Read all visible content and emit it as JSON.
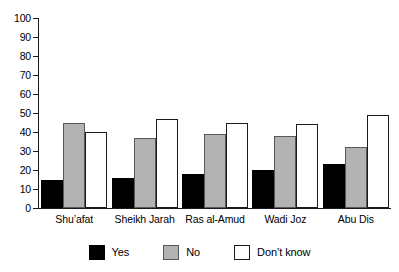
{
  "chart_data": {
    "type": "bar",
    "title": "",
    "xlabel": "",
    "ylabel": "",
    "ylim": [
      0,
      100
    ],
    "yticks": [
      0,
      10,
      20,
      30,
      40,
      50,
      60,
      70,
      80,
      90,
      100
    ],
    "grid": false,
    "legend_position": "bottom",
    "categories": [
      "Shu’afat",
      "Sheikh Jarah",
      "Ras al-Amud",
      "Wadi Joz",
      "Abu Dis"
    ],
    "series": [
      {
        "name": "Yes",
        "color": "#000000",
        "values": [
          15,
          16,
          18,
          20,
          23
        ]
      },
      {
        "name": "No",
        "color": "#b3b3b3",
        "values": [
          45,
          37,
          39,
          38,
          32
        ]
      },
      {
        "name": "Don’t know",
        "color": "#ffffff",
        "values": [
          40,
          47,
          45,
          44,
          49
        ]
      }
    ]
  },
  "axis": {
    "y_tick_labels": [
      "100",
      "90",
      "80",
      "70",
      "60",
      "50",
      "40",
      "30",
      "20",
      "10",
      "0"
    ]
  },
  "legend": {
    "items": [
      {
        "label": "Yes",
        "swatch": "black-filled-square"
      },
      {
        "label": "No",
        "swatch": "gray-filled-square"
      },
      {
        "label": "Don’t know",
        "swatch": "white-outlined-square"
      }
    ]
  },
  "colors": {
    "yes": "#000000",
    "no": "#b3b3b3",
    "dont_know": "#ffffff",
    "axis": "#1a1a1a",
    "background": "#ffffff"
  }
}
